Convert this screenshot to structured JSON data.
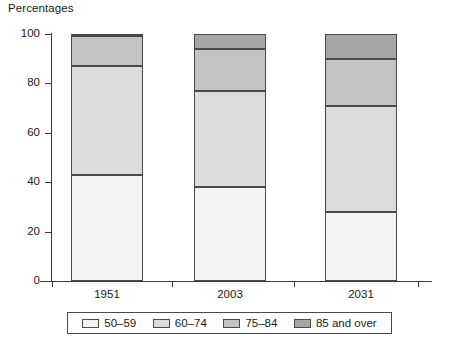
{
  "chart_data": {
    "type": "bar",
    "title": "",
    "subtitle": "",
    "ylabel": "Percentages",
    "xlabel": "",
    "categories": [
      "1951",
      "2003",
      "2031"
    ],
    "ylim": [
      0,
      100
    ],
    "yticks": [
      0,
      20,
      40,
      60,
      80,
      100
    ],
    "ytick_labels": [
      "0",
      "20",
      "40",
      "60",
      "80",
      "100"
    ],
    "stacked": true,
    "grid": false,
    "legend_position": "bottom",
    "series": [
      {
        "name": "50–59",
        "color": "#f4f4f2",
        "values": [
          43,
          38,
          28
        ]
      },
      {
        "name": "60–74",
        "color": "#dcdcda",
        "values": [
          44,
          39,
          43
        ]
      },
      {
        "name": "75–84",
        "color": "#c3c3c1",
        "values": [
          12,
          17,
          19
        ]
      },
      {
        "name": "85 and over",
        "color": "#a6a6a4",
        "values": [
          1,
          6,
          10
        ]
      }
    ],
    "cumulative_tops": [
      [
        43,
        87,
        99,
        100
      ],
      [
        38,
        77,
        94,
        100
      ],
      [
        28,
        71,
        90,
        100
      ]
    ]
  },
  "axis": {
    "y_title": "Percentages"
  },
  "legend": {
    "items": [
      {
        "label": "50–59"
      },
      {
        "label": "60–74"
      },
      {
        "label": "75–84"
      },
      {
        "label": "85 and over"
      }
    ]
  }
}
